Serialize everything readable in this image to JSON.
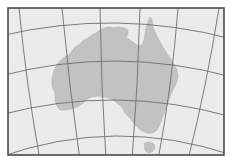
{
  "map": {
    "subject": "Australia",
    "projection_style": "conic graticule",
    "colors": {
      "ocean": "#ebebeb",
      "land": "#c2c2c2",
      "land_stroke": "#b0b0b0",
      "graticule": "#6e6e6e",
      "frame": "#4a4a4a",
      "background": "#ffffff"
    },
    "features": [
      {
        "name": "mainland-australia"
      },
      {
        "name": "tasmania"
      }
    ],
    "graticule": {
      "meridian_count": 6,
      "parallel_count": 4
    },
    "labels": []
  }
}
